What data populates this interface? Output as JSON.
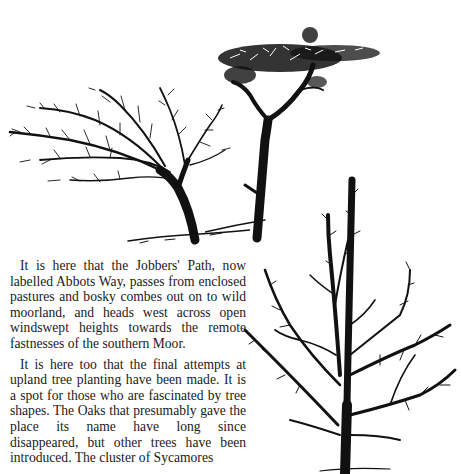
{
  "document": {
    "paragraphs": [
      "It is here that the Jobbers' Path, now labelled Abbots Way, passes from enclosed pastures and bosky combes out on to wild moorland, and heads west across open windswept heights towards the remote fastnesses of the southern Moor.",
      "It is here too that the final attempts at upland tree planting have been made. It is a spot for those who are fascinated by tree shapes. The Oaks that presumably gave the place its name have long since disappeared, but other trees have been introduced. The cluster of Sycamores"
    ],
    "illustrations": [
      {
        "id": "windswept-tree",
        "description": "wind-bent bare tree"
      },
      {
        "id": "flat-top-tree",
        "description": "tall tree with flat leafy crown"
      },
      {
        "id": "bare-conifer-tree",
        "description": "upright bare tree with spreading branches"
      }
    ],
    "colors": {
      "ink": "#111111",
      "paper": "#ffffff"
    }
  }
}
